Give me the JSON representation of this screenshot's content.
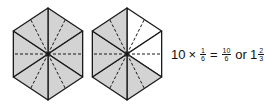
{
  "figure": {
    "colors": {
      "shade": "#d3d3d3",
      "stroke": "#1a1a1a",
      "background": "#ffffff"
    },
    "hexagons": [
      {
        "id": "left",
        "center": [
          48,
          54
        ],
        "shaded_triangles": 6,
        "total_triangles": 6
      },
      {
        "id": "right",
        "center": [
          127,
          54
        ],
        "shaded_triangles": 4,
        "total_triangles": 6,
        "unshaded": [
          "top-right",
          "right"
        ]
      }
    ]
  },
  "equation": {
    "whole": "10",
    "times": "×",
    "frac1": {
      "num": "1",
      "den": "6"
    },
    "equals": "=",
    "frac2": {
      "num": "10",
      "den": "6"
    },
    "or": "or",
    "mixed_whole": "1",
    "frac3": {
      "num": "2",
      "den": "3"
    }
  }
}
